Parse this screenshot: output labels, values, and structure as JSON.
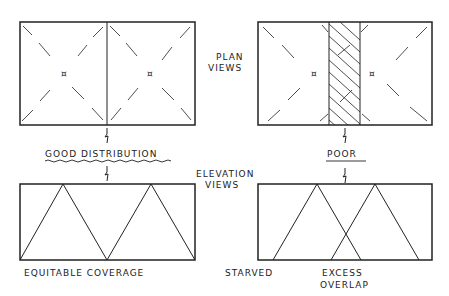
{
  "labels": {
    "plan_views_line1": "PLAN",
    "plan_views_line2": "VIEWS",
    "elevation_views_line1": "ELEVATION",
    "elevation_views_line2": "VIEWS",
    "good_distribution": "GOOD DISTRIBUTION",
    "poor": "POOR",
    "equitable_coverage": "EQUITABLE COVERAGE",
    "starved": "STARVED",
    "excess_line1": "EXCESS",
    "excess_line2": "OVERLAP"
  },
  "colors": {
    "ink": "#222222",
    "background": "#ffffff"
  }
}
